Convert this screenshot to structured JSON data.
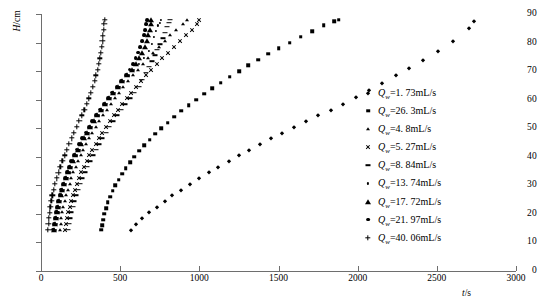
{
  "chart_data": {
    "type": "scatter",
    "title": "",
    "xlabel": "t/s",
    "ylabel": "H/cm",
    "xlim": [
      0,
      3000
    ],
    "ylim": [
      0,
      90
    ],
    "xticks": [
      0,
      500,
      1000,
      1500,
      2000,
      2500,
      3000
    ],
    "yticks": [
      0,
      10,
      20,
      30,
      40,
      50,
      60,
      70,
      80,
      90
    ],
    "grid": false,
    "legend_position": "right",
    "series": [
      {
        "name": "Qw=1.73mL/s",
        "symbol": "Q",
        "subscript": "w",
        "value": "1. 73",
        "unit": "mL/s",
        "marker": "diamond",
        "x": [
          570,
          600,
          640,
          685,
          730,
          780,
          830,
          885,
          940,
          1000,
          1060,
          1120,
          1185,
          1250,
          1315,
          1385,
          1455,
          1525,
          1600,
          1675,
          1750,
          1830,
          1910,
          1990,
          2070,
          2155,
          2240,
          2325,
          2415,
          2505,
          2600,
          2700,
          2735
        ],
        "y": [
          14.5,
          16.5,
          18.5,
          20.5,
          22.5,
          24.5,
          26.5,
          28.5,
          30.5,
          32.5,
          34.5,
          36.5,
          38.5,
          40.5,
          42.5,
          44.5,
          46.5,
          48.5,
          50.5,
          52.5,
          54.5,
          56.5,
          58.5,
          61,
          63.5,
          66,
          68.5,
          71,
          74,
          77,
          80.5,
          85,
          87.5
        ]
      },
      {
        "name": "Qw=26.3mL/s",
        "symbol": "Q",
        "subscript": "w",
        "value": "26. 3",
        "unit": "mL/s",
        "marker": "square",
        "x": [
          380,
          385,
          392,
          400,
          410,
          422,
          436,
          452,
          470,
          490,
          512,
          536,
          562,
          590,
          620,
          652,
          686,
          722,
          760,
          800,
          842,
          886,
          932,
          980,
          1030,
          1082,
          1136,
          1192,
          1250,
          1310,
          1372,
          1436,
          1502,
          1570,
          1640,
          1712,
          1786,
          1850,
          1880
        ],
        "y": [
          14.5,
          16,
          18,
          20,
          22,
          24,
          26,
          28,
          30,
          32,
          34,
          36,
          38,
          40,
          42,
          44,
          46,
          48,
          50,
          52,
          54,
          56,
          58,
          60,
          62,
          64,
          66,
          68,
          70,
          72,
          74,
          76,
          78,
          80,
          82,
          84,
          86,
          87.5,
          88
        ]
      },
      {
        "name": "Qw=4.8mL/s",
        "symbol": "Q",
        "subscript": "w",
        "value": "4. 8",
        "unit": "mL/s",
        "marker": "triangle-small",
        "x": [
          120,
          124,
          129,
          135,
          142,
          150,
          159,
          169,
          180,
          192,
          205,
          219,
          234,
          250,
          267,
          285,
          304,
          324,
          345,
          367,
          390,
          414,
          439,
          465,
          492,
          520,
          549,
          579,
          610,
          642,
          675,
          709,
          744,
          780,
          817,
          855,
          894,
          920
        ],
        "y": [
          14.5,
          16.5,
          18.5,
          20.5,
          22.5,
          24.5,
          26.5,
          28.5,
          30.5,
          32.5,
          34.5,
          36.5,
          38.5,
          40.5,
          42.5,
          44.5,
          46.5,
          48.5,
          50.5,
          52.5,
          54.5,
          56.5,
          58.5,
          60.5,
          62.5,
          64.5,
          66.5,
          68.5,
          70.5,
          72.5,
          74.5,
          76.5,
          78.5,
          80.5,
          82.5,
          84.5,
          86.5,
          88
        ]
      },
      {
        "name": "Qw=5.27mL/s",
        "symbol": "Q",
        "subscript": "w",
        "value": "5. 27",
        "unit": "mL/s",
        "marker": "cross",
        "x": [
          150,
          156,
          163,
          171,
          180,
          190,
          201,
          213,
          226,
          240,
          255,
          271,
          288,
          306,
          325,
          345,
          366,
          388,
          411,
          435,
          460,
          486,
          513,
          541,
          570,
          600,
          631,
          663,
          696,
          730,
          765,
          801,
          838,
          876,
          915,
          955,
          985,
          1000
        ],
        "y": [
          14.5,
          16.5,
          18.5,
          20.5,
          22.5,
          24.5,
          26.5,
          28.5,
          30.5,
          32.5,
          34.5,
          36.5,
          38.5,
          40.5,
          42.5,
          44.5,
          46.5,
          48.5,
          50.5,
          52.5,
          54.5,
          56.5,
          58.5,
          60.5,
          62.5,
          64.5,
          66.5,
          68.5,
          70.5,
          72.5,
          74.5,
          76.5,
          78.5,
          80.5,
          82.5,
          84.5,
          86.5,
          88
        ]
      },
      {
        "name": "Qw=8.84mL/s",
        "symbol": "Q",
        "subscript": "w",
        "value": "8. 84",
        "unit": "mL/s",
        "marker": "dash",
        "x": [
          170,
          176,
          183,
          191,
          200,
          210,
          221,
          233,
          246,
          260,
          275,
          291,
          308,
          326,
          345,
          365,
          386,
          408,
          431,
          455,
          480,
          506,
          533,
          561,
          590,
          620,
          640,
          660,
          680,
          700,
          718,
          735,
          752,
          768,
          782,
          795,
          806,
          815
        ],
        "y": [
          14.5,
          16.5,
          18.5,
          20.5,
          22.5,
          24.5,
          26.5,
          28.5,
          30.5,
          32.5,
          34.5,
          36.5,
          38.5,
          40.5,
          42.5,
          44.5,
          46.5,
          48.5,
          50.5,
          52.5,
          54.5,
          56.5,
          58.5,
          60.5,
          62.5,
          64.5,
          67,
          69.5,
          71.5,
          73.5,
          75.5,
          77.5,
          79.5,
          81.5,
          83.5,
          85.5,
          87,
          88
        ]
      },
      {
        "name": "Qw=13.74mL/s",
        "symbol": "Q",
        "subscript": "w",
        "value": "13. 74",
        "unit": "mL/s",
        "marker": "dot",
        "x": [
          95,
          99,
          104,
          110,
          117,
          125,
          134,
          144,
          155,
          167,
          180,
          194,
          209,
          225,
          242,
          260,
          279,
          299,
          320,
          342,
          365,
          389,
          414,
          440,
          467,
          495,
          524,
          554,
          585,
          617,
          650,
          684,
          700,
          715,
          728,
          740,
          750,
          758
        ],
        "y": [
          14.5,
          16.5,
          18.5,
          20.5,
          22.5,
          24.5,
          26.5,
          28.5,
          30.5,
          32.5,
          34.5,
          36.5,
          38.5,
          40.5,
          42.5,
          44.5,
          46.5,
          48.5,
          50.5,
          52.5,
          54.5,
          56.5,
          58.5,
          60.5,
          62.5,
          64.5,
          66.5,
          68.5,
          70.5,
          72.5,
          74.5,
          77,
          79.5,
          82,
          84,
          86,
          87,
          88
        ]
      },
      {
        "name": "Qw=17.72mL/s",
        "symbol": "Q",
        "subscript": "w",
        "value": "17. 72",
        "unit": "mL/s",
        "marker": "triangle-big",
        "x": [
          85,
          89,
          94,
          100,
          107,
          115,
          124,
          134,
          145,
          157,
          170,
          184,
          199,
          215,
          232,
          250,
          269,
          289,
          310,
          332,
          355,
          379,
          404,
          430,
          457,
          485,
          514,
          544,
          575,
          600,
          622,
          640,
          655,
          668,
          678,
          686,
          692,
          696
        ],
        "y": [
          14.5,
          16.5,
          18.5,
          20.5,
          22.5,
          24.5,
          26.5,
          28.5,
          30.5,
          32.5,
          34.5,
          36.5,
          38.5,
          40.5,
          42.5,
          44.5,
          46.5,
          48.5,
          50.5,
          52.5,
          54.5,
          56.5,
          58.5,
          60.5,
          62.5,
          64.5,
          66.5,
          68.5,
          70.5,
          72.5,
          74.5,
          76.5,
          78.5,
          80.5,
          82.5,
          84.5,
          86.5,
          88
        ]
      },
      {
        "name": "Qw=21.97mL/s",
        "symbol": "Q",
        "subscript": "w",
        "value": "21. 97",
        "unit": "mL/s",
        "marker": "circle",
        "x": [
          78,
          82,
          87,
          93,
          100,
          108,
          117,
          127,
          138,
          150,
          163,
          177,
          192,
          208,
          225,
          243,
          262,
          282,
          303,
          325,
          348,
          372,
          397,
          423,
          450,
          478,
          507,
          537,
          560,
          580,
          598,
          614,
          628,
          640,
          650,
          658,
          664,
          668
        ],
        "y": [
          14.5,
          16.5,
          18.5,
          20.5,
          22.5,
          24.5,
          26.5,
          28.5,
          30.5,
          32.5,
          34.5,
          36.5,
          38.5,
          40.5,
          42.5,
          44.5,
          46.5,
          48.5,
          50.5,
          52.5,
          54.5,
          56.5,
          58.5,
          60.5,
          62.5,
          64.5,
          66.5,
          68.5,
          70.5,
          72.5,
          74.5,
          76.5,
          78.5,
          80.5,
          82.5,
          84.5,
          86.5,
          88
        ]
      },
      {
        "name": "Qw=40.06mL/s",
        "symbol": "Q",
        "subscript": "w",
        "value": "40. 06",
        "unit": "mL/s",
        "marker": "plus",
        "x": [
          45,
          47,
          50,
          54,
          59,
          65,
          72,
          80,
          89,
          99,
          110,
          122,
          135,
          149,
          163,
          178,
          193,
          209,
          225,
          241,
          257,
          273,
          288,
          302,
          315,
          327,
          338,
          348,
          357,
          365,
          372,
          378,
          383,
          388,
          392,
          396,
          399,
          402
        ],
        "y": [
          14.5,
          16.5,
          18.5,
          20.5,
          22.5,
          24.5,
          26.5,
          28.5,
          30.5,
          32.5,
          34.5,
          36.5,
          38.5,
          40.5,
          42.5,
          44.5,
          46.5,
          48.5,
          50.5,
          52.5,
          54.5,
          56.5,
          58.5,
          60.5,
          62.5,
          64.5,
          66.5,
          68.5,
          70.5,
          72.5,
          74.5,
          76.5,
          78.5,
          80.5,
          82.5,
          84.5,
          86.5,
          88
        ]
      }
    ]
  }
}
